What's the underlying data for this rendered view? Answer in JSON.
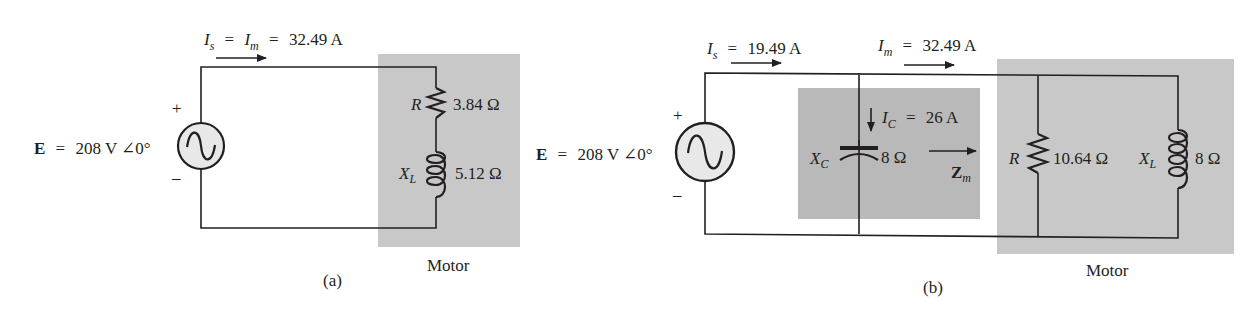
{
  "colors": {
    "ink": "#231f20",
    "shade_motor": "#c8c8c8",
    "shade_capacitor": "#b9b9b9",
    "source_fill": "#e8e8e8"
  },
  "diagram_a": {
    "caption": "(a)",
    "current_label": {
      "I": "I",
      "s": "s",
      "eq1": "=",
      "I2": "I",
      "m": "m",
      "eq2": "=",
      "value": "32.49 A"
    },
    "source": {
      "E": "E",
      "eq": "=",
      "value": "208 V ∠0°",
      "plus": "+",
      "minus": "–"
    },
    "resistor": {
      "symbol": "R",
      "value": "3.84 Ω"
    },
    "inductor": {
      "symbol": "X",
      "sub": "L",
      "value": "5.12 Ω"
    },
    "block_label": "Motor"
  },
  "diagram_b": {
    "caption": "(b)",
    "source_current": {
      "I": "I",
      "s": "s",
      "eq": "=",
      "value": "19.49 A"
    },
    "motor_current": {
      "I": "I",
      "m": "m",
      "eq": "=",
      "value": "32.49 A"
    },
    "source": {
      "E": "E",
      "eq": "=",
      "value": "208 V ∠0°",
      "plus": "+",
      "minus": "–"
    },
    "capacitor": {
      "symbol": "X",
      "sub": "C",
      "value": "8 Ω",
      "current_I": "I",
      "current_sub": "C",
      "current_eq": "=",
      "current_value": "26 A"
    },
    "impedance": {
      "symbol": "Z",
      "sub": "m"
    },
    "resistor": {
      "symbol": "R",
      "value": "10.64 Ω"
    },
    "inductor": {
      "symbol": "X",
      "sub": "L",
      "value": "8 Ω"
    },
    "block_label": "Motor"
  }
}
